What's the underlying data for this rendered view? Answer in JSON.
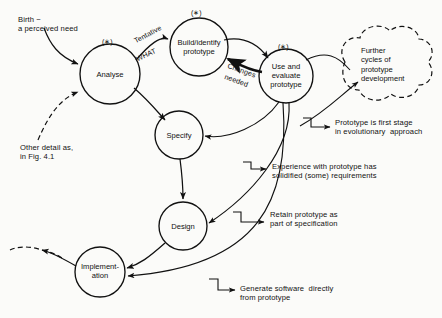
{
  "figure": {
    "style": "hand-drawn flowchart",
    "background_color": "#fbfbf9",
    "ink_color": "#111111"
  },
  "nodes": [
    {
      "id": "analyse",
      "label": "Analyse",
      "marker": "(∗)",
      "cx": 110,
      "cy": 74,
      "r": 30
    },
    {
      "id": "build",
      "label": "Build/identify\nprototype",
      "marker": "(∗)",
      "cx": 199,
      "cy": 47,
      "r": 29
    },
    {
      "id": "use",
      "label": "Use and\nevaluate\nprototype",
      "marker": "(∗)",
      "cx": 286,
      "cy": 76,
      "r": 27
    },
    {
      "id": "specify",
      "label": "Specify",
      "marker": "",
      "cx": 179,
      "cy": 135,
      "r": 24
    },
    {
      "id": "design",
      "label": "Design",
      "marker": "",
      "cx": 183,
      "cy": 226,
      "r": 24
    },
    {
      "id": "implement",
      "label": "Implement-\nation",
      "marker": "",
      "cx": 100,
      "cy": 272,
      "r": 25
    }
  ],
  "cloud": {
    "label": "Further\ncycles of\nprototype\ndevelopment",
    "cx": 382,
    "cy": 68,
    "border_style": "dashed"
  },
  "edge_labels": [
    {
      "id": "tentative-what",
      "line1": "Tentative",
      "line2": "WHAT"
    },
    {
      "id": "changes-needed",
      "line1": "Changes",
      "line2": "needed"
    }
  ],
  "annotations": [
    {
      "id": "birth",
      "text": "Birth −\na perceived need",
      "x": 18,
      "y": 16
    },
    {
      "id": "other-detail",
      "text": "Other detail as,\nin Fig. 4.1",
      "x": 20,
      "y": 144
    },
    {
      "id": "prototype-first-stage",
      "text": "Prototype is first stage\nin evolutionary  approach",
      "x": 335,
      "y": 119
    },
    {
      "id": "experience-solidified",
      "text": "Experience with prototype has\nsolidified (some) requirements",
      "x": 272,
      "y": 163
    },
    {
      "id": "retain-prototype",
      "text": "Retain prototype as\npart of specification",
      "x": 270,
      "y": 211
    },
    {
      "id": "generate-software",
      "text": "Generate software  directly\nfrom prototype",
      "x": 240,
      "y": 285
    }
  ]
}
